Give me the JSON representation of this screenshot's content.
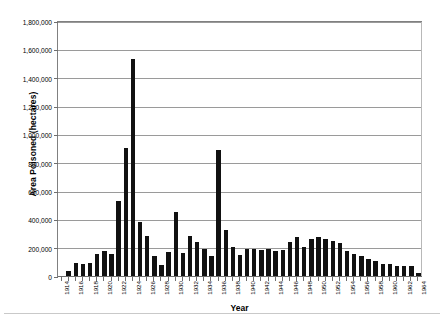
{
  "chart_data": {
    "type": "bar",
    "title": "",
    "xlabel": "Year",
    "ylabel": "Area Poisoned (hectares)",
    "ylim": [
      0,
      1800000
    ],
    "ytick_step": 200000,
    "ytick_labels": [
      "0",
      "200,000",
      "400,000",
      "600,000",
      "800,000",
      "1,000,000",
      "1,200,000",
      "1,400,000",
      "1,600,000",
      "1,800,000"
    ],
    "ytick_values": [
      0,
      200000,
      400000,
      600000,
      800000,
      1000000,
      1200000,
      1400000,
      1600000,
      1800000
    ],
    "grid": true,
    "legend": "none",
    "bar_color": "#111111",
    "xtick_label_rotation": -90,
    "xtick_label_interval": 2,
    "xtick_labels": [
      "1914",
      "1916",
      "1918",
      "1920",
      "1922",
      "1924",
      "1926",
      "1928",
      "1930",
      "1932",
      "1934",
      "1936",
      "1938",
      "1940",
      "1942",
      "1944",
      "1946",
      "1948",
      "1950",
      "1952",
      "1954",
      "1956",
      "1958",
      "1960",
      "1962",
      "1964"
    ],
    "categories": [
      "1914",
      "1915",
      "1916",
      "1917",
      "1918",
      "1919",
      "1920",
      "1921",
      "1922",
      "1923",
      "1924",
      "1925",
      "1926",
      "1927",
      "1928",
      "1929",
      "1930",
      "1931",
      "1932",
      "1933",
      "1934",
      "1935",
      "1936",
      "1937",
      "1938",
      "1939",
      "1940",
      "1941",
      "1942",
      "1943",
      "1944",
      "1945",
      "1946",
      "1947",
      "1948",
      "1949",
      "1950",
      "1951",
      "1952",
      "1953",
      "1954",
      "1955",
      "1956",
      "1957",
      "1958",
      "1959",
      "1960",
      "1961",
      "1962",
      "1963",
      "1964"
    ],
    "values": [
      10000,
      45000,
      100000,
      95000,
      100000,
      160000,
      185000,
      165000,
      540000,
      910000,
      1540000,
      385000,
      290000,
      150000,
      85000,
      175000,
      460000,
      170000,
      290000,
      250000,
      195000,
      145000,
      900000,
      330000,
      215000,
      155000,
      195000,
      195000,
      190000,
      195000,
      185000,
      190000,
      250000,
      285000,
      215000,
      270000,
      285000,
      265000,
      255000,
      240000,
      185000,
      160000,
      150000,
      130000,
      110000,
      95000,
      90000,
      80000,
      80000,
      75000,
      30000
    ]
  }
}
